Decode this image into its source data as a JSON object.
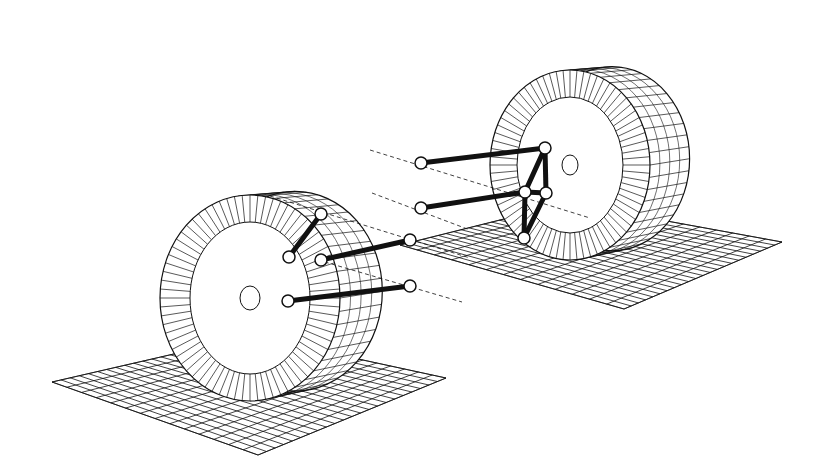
{
  "diagram": {
    "title": "Multi-link suspension wireframe model",
    "background": "#ffffff",
    "stroke_color": "#111111",
    "wheels": [
      {
        "id": "front-left-wheel",
        "cx": 250,
        "cy": 298,
        "rx": 90,
        "ry": 103,
        "hub_rx": 60,
        "hub_ry": 76,
        "center_rx": 10,
        "center_ry": 12,
        "depth": 45,
        "ground": {
          "cx": 250,
          "cy": 410
        }
      },
      {
        "id": "rear-right-wheel",
        "cx": 570,
        "cy": 165,
        "rx": 80,
        "ry": 95,
        "hub_rx": 53,
        "hub_ry": 68,
        "center_rx": 8,
        "center_ry": 10,
        "depth": 42,
        "ground": {
          "cx": 598,
          "cy": 258
        }
      }
    ],
    "ground_planes": [
      {
        "id": "front-ground-grid",
        "points": [
          [
            52,
            382
          ],
          [
            252,
            336
          ],
          [
            446,
            378
          ],
          [
            258,
            455
          ]
        ],
        "rows": 14,
        "cols": 22
      },
      {
        "id": "rear-ground-grid",
        "points": [
          [
            400,
            245
          ],
          [
            568,
            203
          ],
          [
            782,
            242
          ],
          [
            624,
            309
          ]
        ],
        "rows": 13,
        "cols": 22
      }
    ],
    "joints": [
      {
        "id": "j1",
        "x": 321,
        "y": 214
      },
      {
        "id": "j2",
        "x": 289,
        "y": 257
      },
      {
        "id": "j3",
        "x": 321,
        "y": 260
      },
      {
        "id": "j4",
        "x": 410,
        "y": 240
      },
      {
        "id": "j5",
        "x": 288,
        "y": 301
      },
      {
        "id": "j6",
        "x": 410,
        "y": 286
      },
      {
        "id": "j7",
        "x": 421,
        "y": 163
      },
      {
        "id": "j8",
        "x": 421,
        "y": 208
      },
      {
        "id": "j9",
        "x": 545,
        "y": 148
      },
      {
        "id": "j10",
        "x": 525,
        "y": 192
      },
      {
        "id": "j11",
        "x": 546,
        "y": 193
      },
      {
        "id": "j12",
        "x": 524,
        "y": 238
      }
    ],
    "links": [
      {
        "from": "j1",
        "to": "j2"
      },
      {
        "from": "j3",
        "to": "j4"
      },
      {
        "from": "j5",
        "to": "j6"
      },
      {
        "from": "j7",
        "to": "j9"
      },
      {
        "from": "j8",
        "to": "j10"
      },
      {
        "from": "j9",
        "to": "j11"
      },
      {
        "from": "j9",
        "to": "j10"
      },
      {
        "from": "j10",
        "to": "j11"
      },
      {
        "from": "j11",
        "to": "j12"
      },
      {
        "from": "j10",
        "to": "j12"
      }
    ],
    "axis_lines": [
      {
        "x1": 370,
        "y1": 150,
        "x2": 590,
        "y2": 218
      },
      {
        "x1": 372,
        "y1": 193,
        "x2": 470,
        "y2": 230
      },
      {
        "x1": 270,
        "y1": 196,
        "x2": 470,
        "y2": 258
      },
      {
        "x1": 318,
        "y1": 260,
        "x2": 462,
        "y2": 302
      }
    ]
  }
}
